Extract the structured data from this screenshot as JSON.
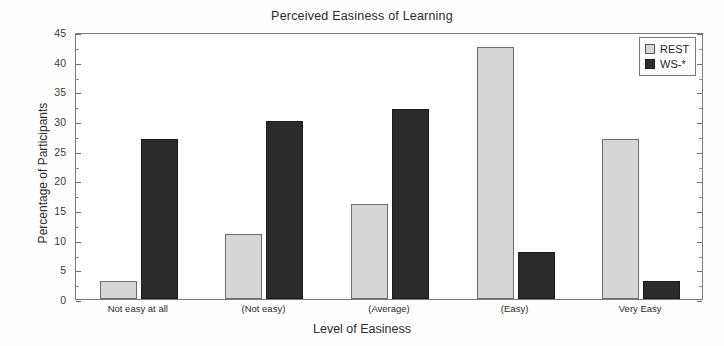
{
  "chart_data": {
    "type": "bar",
    "title": "Perceived Easiness of Learning",
    "xlabel": "Level of Easiness",
    "ylabel": "Percentage of Participants",
    "categories": [
      "Not easy at all",
      "(Not easy)",
      "(Average)",
      "(Easy)",
      "Very Easy"
    ],
    "series": [
      {
        "name": "REST",
        "color": "#d6d6d6",
        "values": [
          3,
          11,
          16,
          42.5,
          27
        ]
      },
      {
        "name": "WS-*",
        "color": "#2b2b2b",
        "values": [
          27,
          30,
          32,
          8,
          3
        ]
      }
    ],
    "ylim": [
      0,
      45
    ],
    "yticks": [
      0,
      5,
      10,
      15,
      20,
      25,
      30,
      35,
      40,
      45
    ],
    "ytick_labels": [
      "0",
      "5",
      "10",
      "15",
      "20",
      "25",
      "30",
      "35",
      "40",
      "45"
    ],
    "minor_tick_step": 2.5,
    "grid": false,
    "legend_position": "top-right",
    "legend_entries": [
      "REST",
      "WS-*"
    ]
  },
  "axes": {
    "y_title": "Percentage of Participants",
    "x_title": "Level of Easiness"
  },
  "legend": {
    "items": [
      {
        "label": "REST",
        "swatch": "rest"
      },
      {
        "label": "WS-*",
        "swatch": "ws"
      }
    ]
  }
}
